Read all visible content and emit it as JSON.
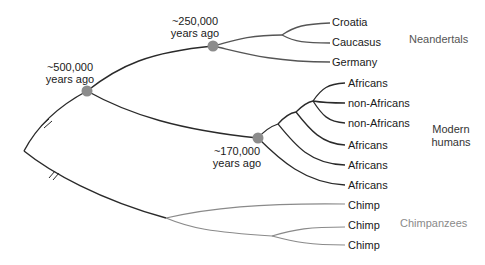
{
  "diagram": {
    "type": "phylogenetic-tree",
    "colors": {
      "main_branch": "#2a2a2a",
      "neandertal_branch": "#555555",
      "human_branch": "#2a2a2a",
      "chimp_branch": "#8a8a8a",
      "node_dot": "#8c8c8c",
      "neandertal_label": "#555555",
      "human_label": "#333333",
      "chimp_label": "#8a8a8a"
    },
    "nodes": [
      {
        "id": "split-500k",
        "label_line1": "~500,000",
        "label_line2": "years ago"
      },
      {
        "id": "split-250k",
        "label_line1": "~250,000",
        "label_line2": "years ago"
      },
      {
        "id": "split-170k",
        "label_line1": "~170,000",
        "label_line2": "years ago"
      }
    ],
    "groups": [
      {
        "name": "Neandertals",
        "leaves": [
          "Croatia",
          "Caucasus",
          "Germany"
        ]
      },
      {
        "name_line1": "Modern",
        "name_line2": "humans",
        "leaves": [
          "Africans",
          "non-Africans",
          "non-Africans",
          "Africans",
          "Africans",
          "Africans"
        ]
      },
      {
        "name": "Chimpanzees",
        "leaves": [
          "Chimp",
          "Chimp",
          "Chimp"
        ]
      }
    ]
  }
}
